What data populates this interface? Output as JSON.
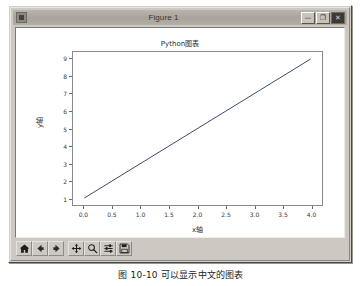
{
  "window": {
    "title": "Figure 1",
    "icon": "figure-window-icon",
    "controls": {
      "minimize_label": "—",
      "maximize_label": "❐",
      "close_label": "✕"
    }
  },
  "toolbar": {
    "buttons": [
      {
        "name": "home-button",
        "icon": "home-icon",
        "tooltip": "Reset original view"
      },
      {
        "name": "back-button",
        "icon": "arrow-left-icon",
        "tooltip": "Back to previous view"
      },
      {
        "name": "forward-button",
        "icon": "arrow-right-icon",
        "tooltip": "Forward to next view"
      },
      {
        "name": "pan-button",
        "icon": "pan-move-icon",
        "tooltip": "Pan axes with left mouse"
      },
      {
        "name": "zoom-button",
        "icon": "magnifier-icon",
        "tooltip": "Zoom to rectangle"
      },
      {
        "name": "configure-subplots-button",
        "icon": "sliders-icon",
        "tooltip": "Configure subplots"
      },
      {
        "name": "save-button",
        "icon": "floppy-disk-icon",
        "tooltip": "Save the figure"
      }
    ]
  },
  "caption": {
    "text": "图 10-10   可以显示中文的图表"
  },
  "chart_data": {
    "type": "line",
    "title": "Python图表",
    "xlabel": "x轴",
    "ylabel": "y轴",
    "x": [
      0.0,
      4.0
    ],
    "y": [
      1.0,
      9.0
    ],
    "series": [
      {
        "name": "y = 2x + 1",
        "x": [
          0.0,
          4.0
        ],
        "values": [
          1.0,
          9.0
        ]
      }
    ],
    "xlim": [
      -0.2,
      4.2
    ],
    "ylim": [
      0.6,
      9.4
    ],
    "xticks": [
      "0.0",
      "0.5",
      "1.0",
      "1.5",
      "2.0",
      "2.5",
      "3.0",
      "3.5",
      "4.0"
    ],
    "xtick_values": [
      0.0,
      0.5,
      1.0,
      1.5,
      2.0,
      2.5,
      3.0,
      3.5,
      4.0
    ],
    "yticks": [
      "1",
      "2",
      "3",
      "4",
      "5",
      "6",
      "7",
      "8",
      "9"
    ],
    "ytick_values": [
      1,
      2,
      3,
      4,
      5,
      6,
      7,
      8,
      9
    ],
    "grid": false,
    "legend": null,
    "line_color": "#3b4a6b"
  }
}
